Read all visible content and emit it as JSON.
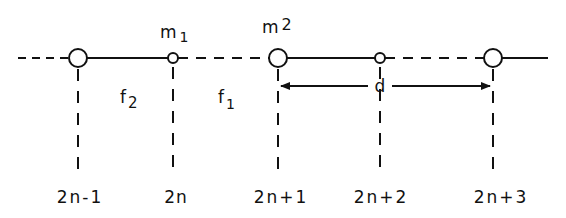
{
  "diagram": {
    "type": "diatomic-linear-chain",
    "masses": {
      "m1_label": "m",
      "m1_sub": "1",
      "m2_label": "m",
      "m2_sub": "2"
    },
    "springs": {
      "f2_label": "f",
      "f2_sub": "2",
      "f1_label": "f",
      "f1_sub": "1"
    },
    "distance_label": "d",
    "site_indices": [
      "2n-1",
      "2n",
      "2n+1",
      "2n+2",
      "2n+3"
    ],
    "sites": [
      {
        "index": "2n-1",
        "x": 78,
        "size": "large"
      },
      {
        "index": "2n",
        "x": 173,
        "size": "small"
      },
      {
        "index": "2n+1",
        "x": 278,
        "size": "large"
      },
      {
        "index": "2n+2",
        "x": 380,
        "size": "small"
      },
      {
        "index": "2n+3",
        "x": 493,
        "size": "large"
      }
    ],
    "colors": {
      "ink": "#111111",
      "background": "#ffffff"
    }
  }
}
